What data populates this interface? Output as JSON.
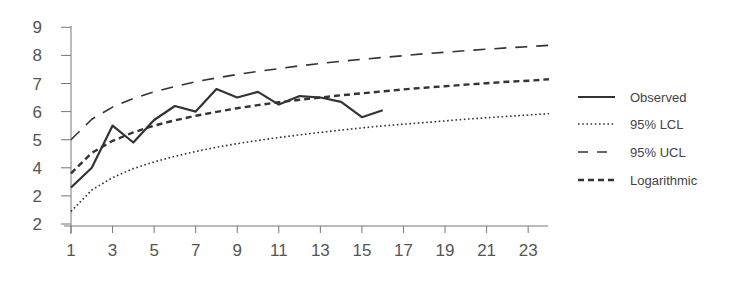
{
  "chart_data": {
    "type": "line",
    "title": "",
    "xlabel": "",
    "ylabel": "",
    "xlim": [
      1,
      24
    ],
    "ylim": [
      2,
      9
    ],
    "grid": false,
    "legend_position": "right",
    "x_ticks": [
      "1",
      "3",
      "5",
      "7",
      "9",
      "11",
      "13",
      "15",
      "17",
      "19",
      "21",
      "23"
    ],
    "x_tick_values": [
      1,
      3,
      5,
      7,
      9,
      11,
      13,
      15,
      17,
      19,
      21,
      23
    ],
    "y_ticks": [
      "9",
      "8",
      "7",
      "6",
      "5",
      "4",
      "2",
      "2"
    ],
    "y_tick_values": [
      9,
      8,
      7,
      6,
      5,
      4,
      3,
      2
    ],
    "x": [
      1,
      2,
      3,
      4,
      5,
      6,
      7,
      8,
      9,
      10,
      11,
      12,
      13,
      14,
      15,
      16,
      17,
      18,
      19,
      20,
      21,
      22,
      23,
      24
    ],
    "series": [
      {
        "name": "Observed",
        "style": "solid",
        "x": [
          1,
          2,
          3,
          4,
          5,
          6,
          7,
          8,
          9,
          10,
          11,
          12,
          13,
          14,
          15,
          16
        ],
        "values": [
          3.3,
          4.0,
          5.5,
          4.9,
          5.7,
          6.2,
          6.0,
          6.8,
          6.5,
          6.7,
          6.25,
          6.55,
          6.5,
          6.35,
          5.8,
          6.05
        ]
      },
      {
        "name": "95% LCL",
        "style": "dotted",
        "x": [
          1,
          2,
          3,
          4,
          5,
          6,
          7,
          8,
          9,
          10,
          11,
          12,
          13,
          14,
          15,
          16,
          17,
          18,
          19,
          20,
          21,
          22,
          23,
          24
        ],
        "values": [
          2.45,
          3.21,
          3.65,
          3.97,
          4.21,
          4.41,
          4.58,
          4.73,
          4.86,
          4.97,
          5.08,
          5.17,
          5.26,
          5.34,
          5.42,
          5.49,
          5.55,
          5.61,
          5.67,
          5.73,
          5.78,
          5.83,
          5.88,
          5.93
        ]
      },
      {
        "name": "95% UCL",
        "style": "long-dash",
        "x": [
          1,
          2,
          3,
          4,
          5,
          6,
          7,
          8,
          9,
          10,
          11,
          12,
          13,
          14,
          15,
          16,
          17,
          18,
          19,
          20,
          21,
          22,
          23,
          24
        ],
        "values": [
          5.0,
          5.73,
          6.16,
          6.47,
          6.7,
          6.89,
          7.06,
          7.2,
          7.32,
          7.43,
          7.53,
          7.63,
          7.71,
          7.79,
          7.86,
          7.93,
          7.99,
          8.06,
          8.11,
          8.17,
          8.22,
          8.27,
          8.31,
          8.36
        ]
      },
      {
        "name": "Logarithmic",
        "style": "short-dash",
        "x": [
          1,
          2,
          3,
          4,
          5,
          6,
          7,
          8,
          9,
          10,
          11,
          12,
          13,
          14,
          15,
          16,
          17,
          18,
          19,
          20,
          21,
          22,
          23,
          24
        ],
        "values": [
          3.8,
          4.53,
          4.96,
          5.26,
          5.5,
          5.69,
          5.85,
          5.99,
          6.12,
          6.23,
          6.33,
          6.42,
          6.5,
          6.58,
          6.65,
          6.72,
          6.79,
          6.85,
          6.9,
          6.96,
          7.01,
          7.06,
          7.1,
          7.15
        ]
      }
    ]
  },
  "legend": {
    "items": [
      {
        "label": "Observed",
        "style": "solid"
      },
      {
        "label": "95% LCL",
        "style": "dotted"
      },
      {
        "label": "95% UCL",
        "style": "long-dash"
      },
      {
        "label": "Logarithmic",
        "style": "short-dash"
      }
    ]
  },
  "colors": {
    "line": "#333333",
    "axis": "#777777",
    "text": "#555555"
  }
}
